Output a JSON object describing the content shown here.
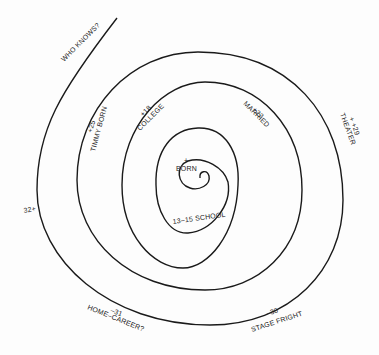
{
  "diagram": {
    "type": "life-spiral",
    "stroke_color": "#1a1a1a",
    "background": "#fdfdfd",
    "spiral_path": "M 200 178 C 200 172, 208 170, 209 177 C 210 186, 198 190, 190 188 C 176 185, 174 166, 187 160 A 45 45 0 0 1 235 180 A 46 52 0 0 1 188 234 A 34 56 0 0 1 156 178 L 156 176 A 42 50 0 0 1 190 128 A 45 52 0 0 1 235 180 M 156 176 Z",
    "labels": [
      {
        "id": "born-marker",
        "text": "+",
        "x": 184,
        "y": 163,
        "rot": 0
      },
      {
        "id": "born",
        "text": "BORN",
        "x": 176,
        "y": 171,
        "rot": 0
      },
      {
        "id": "school",
        "text": "13–15 SCHOOL",
        "x": 173,
        "y": 224,
        "rot": -8
      },
      {
        "id": "college-age",
        "text": "+18",
        "x": 143,
        "y": 117,
        "rot": -45
      },
      {
        "id": "college",
        "text": "COLLEGE",
        "x": 140,
        "y": 131,
        "rot": -45
      },
      {
        "id": "married-age",
        "text": "+22",
        "x": 252,
        "y": 110,
        "rot": 45
      },
      {
        "id": "married",
        "text": "MARRIED",
        "x": 243,
        "y": 104,
        "rot": 45
      },
      {
        "id": "timmy-age",
        "text": "+25",
        "x": 92,
        "y": 133,
        "rot": -75
      },
      {
        "id": "timmy",
        "text": "TIMMY BORN",
        "x": 95,
        "y": 152,
        "rot": -75
      },
      {
        "id": "theater-age",
        "text": "+ +29",
        "x": 349,
        "y": 118,
        "rot": 70
      },
      {
        "id": "theater",
        "text": "THEATER",
        "x": 340,
        "y": 114,
        "rot": 70
      },
      {
        "id": "stage-age",
        "text": "–30",
        "x": 267,
        "y": 316,
        "rot": -18
      },
      {
        "id": "stage",
        "text": "STAGE FRIGHT",
        "x": 252,
        "y": 332,
        "rot": -18
      },
      {
        "id": "home-age",
        "text": "–31",
        "x": 110,
        "y": 312,
        "rot": 22
      },
      {
        "id": "home",
        "text": "HOME–CAREER?",
        "x": 87,
        "y": 309,
        "rot": 22
      },
      {
        "id": "age32",
        "text": "32+",
        "x": 24,
        "y": 213,
        "rot": -10
      },
      {
        "id": "who",
        "text": "WHO KNOWS?",
        "x": 64,
        "y": 62,
        "rot": -45
      }
    ],
    "events": [
      {
        "age": "0",
        "event": "BORN"
      },
      {
        "age": "13–15",
        "event": "SCHOOL"
      },
      {
        "age": "18",
        "event": "COLLEGE"
      },
      {
        "age": "22",
        "event": "MARRIED"
      },
      {
        "age": "25",
        "event": "TIMMY BORN"
      },
      {
        "age": "29",
        "event": "THEATER"
      },
      {
        "age": "30",
        "event": "STAGE FRIGHT"
      },
      {
        "age": "31",
        "event": "HOME–CAREER?"
      },
      {
        "age": "32+",
        "event": ""
      },
      {
        "age": "",
        "event": "WHO KNOWS?"
      }
    ]
  }
}
